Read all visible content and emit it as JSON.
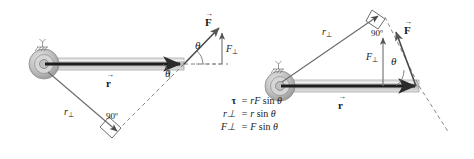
{
  "figure": {
    "type": "physics-vector-diagram",
    "background_color": "#ffffff",
    "ink_color": "#1a1a1a",
    "rod_fill_color": "#c9c9c9",
    "hub_color": "#b3b3b3"
  },
  "equations": [
    {
      "lhs": "τ",
      "lhs_is_tau": true,
      "rhs_pre": "rF",
      "rhs_fn": " sin ",
      "rhs_angle": "θ"
    },
    {
      "lhs": "r⊥",
      "lhs_is_tau": false,
      "rhs_pre": "r",
      "rhs_fn": " sin ",
      "rhs_angle": "θ"
    },
    {
      "lhs": "F⊥",
      "lhs_is_tau": false,
      "rhs_pre": "F",
      "rhs_fn": " sin ",
      "rhs_angle": "θ"
    }
  ],
  "equation_strings": [
    "τ = rF sin θ",
    "r⊥ = r sin θ",
    "F⊥ = F sin θ"
  ],
  "left_panel": {
    "name": "lever-arm-construction",
    "labels": {
      "force_vector": "F",
      "force_perp": "F",
      "force_perp_sub": "⊥",
      "position_vector": "r",
      "lever_arm": "r",
      "lever_arm_sub": "⊥",
      "angle_at_rod_tip": "θ",
      "angle_above_axis": "θ",
      "right_angle": "90º",
      "axis_symbol": "axis-of-rotation"
    }
  },
  "right_panel": {
    "name": "force-component-construction",
    "labels": {
      "force_vector": "F",
      "force_perp": "F",
      "force_perp_sub": "⊥",
      "position_vector": "r",
      "lever_arm": "r",
      "lever_arm_sub": "⊥",
      "angle_at_rod_tip": "θ",
      "right_angle": "90º",
      "axis_symbol": "axis-of-rotation"
    }
  }
}
